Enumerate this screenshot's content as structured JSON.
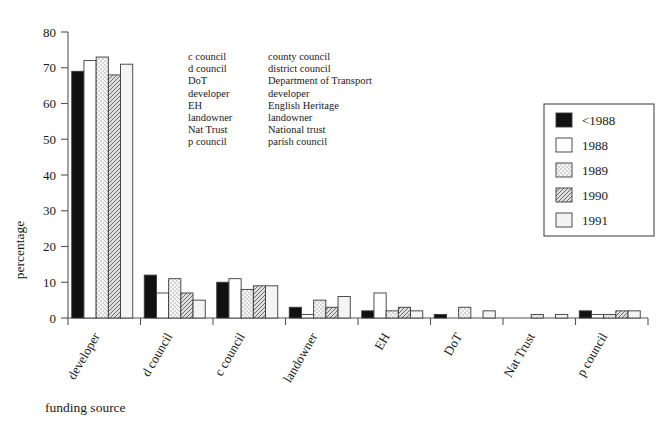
{
  "chart_data": {
    "type": "bar",
    "title": "",
    "xlabel": "funding source",
    "ylabel": "percentage",
    "ylim": [
      0,
      80
    ],
    "yticks": [
      0,
      10,
      20,
      30,
      40,
      50,
      60,
      70,
      80
    ],
    "grid": false,
    "legend_position": "right",
    "categories": [
      "developer",
      "d council",
      "c council",
      "landowner",
      "EH",
      "DoT",
      "Nat Trust",
      "p council"
    ],
    "series": [
      {
        "name": "<1988",
        "values": [
          69,
          12,
          10,
          3,
          2,
          1,
          0,
          2
        ]
      },
      {
        "name": "1988",
        "values": [
          72,
          7,
          11,
          1,
          7,
          0,
          0,
          1
        ]
      },
      {
        "name": "1989",
        "values": [
          73,
          11,
          8,
          5,
          2,
          3,
          1,
          1
        ]
      },
      {
        "name": "1990",
        "values": [
          68,
          7,
          9,
          3,
          3,
          0,
          0,
          2
        ]
      },
      {
        "name": "1991",
        "values": [
          71,
          5,
          9,
          6,
          2,
          2,
          1,
          2
        ]
      }
    ]
  },
  "axis": {
    "y_title": "percentage",
    "x_title": "funding source",
    "y_tick_labels": [
      "0",
      "10",
      "20",
      "30",
      "40",
      "50",
      "60",
      "70",
      "80"
    ],
    "x_tick_labels": [
      "developer",
      "d council",
      "c council",
      "landowner",
      "EH",
      "DoT",
      "Nat Trust",
      "p council"
    ]
  },
  "legend": {
    "entries": [
      {
        "label": "<1988",
        "swatch": "solid-black-swatch"
      },
      {
        "label": "1988",
        "swatch": "white-swatch"
      },
      {
        "label": "1989",
        "swatch": "light-dotted-swatch"
      },
      {
        "label": "1990",
        "swatch": "dark-hatched-swatch"
      },
      {
        "label": "1991",
        "swatch": "pale-gray-swatch"
      }
    ]
  },
  "abbreviations": {
    "rows": [
      {
        "short": "c council",
        "full": "county council"
      },
      {
        "short": "d council",
        "full": "district council"
      },
      {
        "short": "DoT",
        "full": "Department of Transport"
      },
      {
        "short": "developer",
        "full": "developer"
      },
      {
        "short": "EH",
        "full": "English Heritage"
      },
      {
        "short": "landowner",
        "full": "landowner"
      },
      {
        "short": "Nat Trust",
        "full": "National trust"
      },
      {
        "short": "p council",
        "full": "parish council"
      }
    ]
  },
  "colors": {
    "series_1": "#111111",
    "series_2": "#ffffff",
    "series_3": "#eeeeee",
    "series_4": "#c9c9c9",
    "series_5": "#f5f5f5",
    "axis": "#555555",
    "text": "#1a1a1a"
  }
}
